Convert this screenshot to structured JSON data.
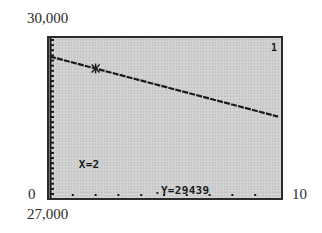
{
  "chart_data": {
    "type": "line",
    "title": "",
    "xlabel": "",
    "ylabel": "",
    "xlim": [
      0,
      10
    ],
    "ylim": [
      27000,
      30000
    ],
    "x_tick_labels": {
      "min": "0",
      "max": "10"
    },
    "y_tick_labels": {
      "min": "27,000",
      "max": "30,000"
    },
    "grid": false,
    "legend": null,
    "plot_number": "1",
    "series": [
      {
        "name": "Y1",
        "x": [
          0,
          2,
          10
        ],
        "values": [
          29667,
          29439,
          28527
        ]
      }
    ],
    "trace_cursor": {
      "x": 2,
      "y": 29439
    },
    "x_ticks": [
      1,
      2,
      3,
      4,
      5,
      6,
      7,
      8,
      9
    ],
    "y_tick_count": 30
  },
  "labels": {
    "y_max": "30,000",
    "y_min": "27,000",
    "x_min": "0",
    "x_max": "10"
  },
  "screen": {
    "plot_number": "1",
    "x_readout": "X=2",
    "y_readout": "Y=29439",
    "colors": {
      "background": "#cfcfcf",
      "ink": "#1a1a1a",
      "frame": "#2b2b2b"
    }
  }
}
